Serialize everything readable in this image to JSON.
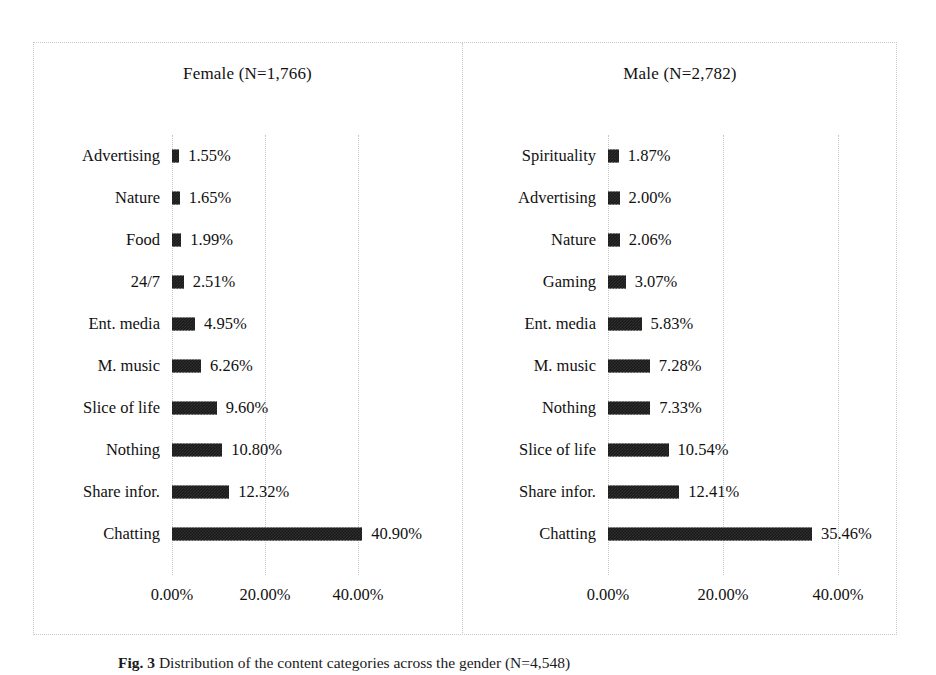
{
  "figure": {
    "caption_label": "Fig. 3",
    "caption_text": "Distribution of the content categories across the gender (N=4,548)"
  },
  "chart_data": [
    {
      "type": "bar",
      "orientation": "horizontal",
      "title": "Female (N=1,766)",
      "xlabel": "",
      "ylabel": "",
      "xlim": [
        0,
        46
      ],
      "xticks": [
        0,
        20,
        40
      ],
      "xtick_labels": [
        "0.00%",
        "20.00%",
        "40.00%"
      ],
      "grid": true,
      "legend": "none",
      "categories": [
        "Advertising",
        "Nature",
        "Food",
        "24/7",
        "Ent. media",
        "M. music",
        "Slice of life",
        "Nothing",
        "Share infor.",
        "Chatting"
      ],
      "values": [
        1.55,
        1.65,
        1.99,
        2.51,
        4.95,
        6.26,
        9.6,
        10.8,
        12.32,
        40.9
      ],
      "data_labels": [
        "1.55%",
        "1.65%",
        "1.99%",
        "2.51%",
        "4.95%",
        "6.26%",
        "9.60%",
        "10.80%",
        "12.32%",
        "40.90%"
      ]
    },
    {
      "type": "bar",
      "orientation": "horizontal",
      "title": "Male (N=2,782)",
      "xlabel": "",
      "ylabel": "",
      "xlim": [
        0,
        46
      ],
      "xticks": [
        0,
        20,
        40
      ],
      "xtick_labels": [
        "0.00%",
        "20.00%",
        "40.00%"
      ],
      "grid": true,
      "legend": "none",
      "categories": [
        "Spirituality",
        "Advertising",
        "Nature",
        "Gaming",
        "Ent. media",
        "M. music",
        "Nothing",
        "Slice of life",
        "Share infor.",
        "Chatting"
      ],
      "values": [
        1.87,
        2.0,
        2.06,
        3.07,
        5.83,
        7.28,
        7.33,
        10.54,
        12.41,
        35.46
      ],
      "data_labels": [
        "1.87%",
        "2.00%",
        "2.06%",
        "3.07%",
        "5.83%",
        "7.28%",
        "7.33%",
        "10.54%",
        "12.41%",
        "35.46%"
      ]
    }
  ],
  "colors": {
    "bar_fill": "#2e2e2e",
    "bar_pattern": "#121212",
    "gridline": "#c6c6c6",
    "frame": "#c9c9c9",
    "text": "#111111",
    "background": "#ffffff"
  }
}
